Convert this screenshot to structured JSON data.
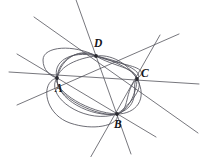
{
  "figure": {
    "kind": "geometry-diagram",
    "width": 205,
    "height": 157,
    "background_color": "#ffffff",
    "line_color": "#4a4a52",
    "curve_color": "#53535c",
    "vertex_color": "#2a2a30",
    "label_color": "#16161a"
  },
  "points": [
    {
      "id": "A",
      "label": "A",
      "x": 57,
      "y": 78,
      "label_x": 55,
      "label_y": 83
    },
    {
      "id": "B",
      "label": "B",
      "x": 117,
      "y": 114,
      "label_x": 114,
      "label_y": 119
    },
    {
      "id": "C",
      "label": "C",
      "x": 137,
      "y": 79,
      "label_x": 141,
      "label_y": 68
    },
    {
      "id": "D",
      "label": "D",
      "x": 96,
      "y": 56,
      "label_x": 94,
      "label_y": 38
    }
  ],
  "lines": [
    {
      "id": "line-AB",
      "from": "A",
      "to": "B",
      "x1": 17,
      "y1": 54,
      "x2": 156,
      "y2": 137
    },
    {
      "id": "line-AC",
      "from": "A",
      "to": "C",
      "x1": 9,
      "y1": 72,
      "x2": 199,
      "y2": 84
    },
    {
      "id": "line-AD",
      "from": "A",
      "to": "D",
      "x1": 17,
      "y1": 105,
      "x2": 179,
      "y2": 34
    },
    {
      "id": "line-BC",
      "from": "B",
      "to": "C",
      "x1": 89,
      "y1": 160,
      "x2": 160,
      "y2": 35
    },
    {
      "id": "line-BD",
      "from": "B",
      "to": "D",
      "x1": 131,
      "y1": 154,
      "x2": 75,
      "y2": -3
    },
    {
      "id": "line-CD",
      "from": "C",
      "to": "D",
      "x1": 34,
      "y1": 17,
      "x2": 198,
      "y2": 133
    }
  ],
  "conics": [
    {
      "id": "conic-1",
      "note": "wide flat ellipse through A,B,C,D"
    },
    {
      "id": "conic-2",
      "note": "tall ellipse through A,B,C,D"
    },
    {
      "id": "conic-3",
      "note": "left-lobed ellipse through A,B,C,D"
    },
    {
      "id": "conic-4",
      "note": "tilted ellipse through A,B,C,D"
    },
    {
      "id": "conic-5",
      "note": "narrow tilted ellipse through A,B,C,D"
    }
  ]
}
